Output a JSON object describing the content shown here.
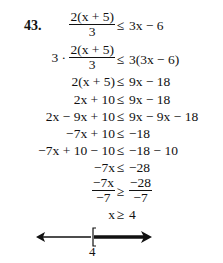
{
  "problem": {
    "number": "43.",
    "steps": [
      {
        "lhs": "",
        "lhs_frac": {
          "num": "2(x + 5)",
          "den": "3"
        },
        "rel": "≤",
        "rhs": "3x − 6"
      },
      {
        "lhs_prefix": "3 ·",
        "lhs_frac": {
          "num": "2(x + 5)",
          "den": "3"
        },
        "rel": "≤",
        "rhs": "3(3x − 6)"
      },
      {
        "lhs": "2(x + 5)",
        "rel": "≤",
        "rhs": "9x − 18"
      },
      {
        "lhs": "2x + 10",
        "rel": "≤",
        "rhs": "9x − 18"
      },
      {
        "lhs": "2x − 9x + 10",
        "rel": "≤",
        "rhs": "9x − 9x − 18"
      },
      {
        "lhs": "−7x + 10",
        "rel": "≤",
        "rhs": "−18"
      },
      {
        "lhs": "−7x + 10 − 10",
        "rel": "≤",
        "rhs": "−18 − 10"
      },
      {
        "lhs": "−7x",
        "rel": "≤",
        "rhs": "−28"
      },
      {
        "lhs_frac": {
          "num": "−7x",
          "den": "−7"
        },
        "rel": "≥",
        "rhs_frac": {
          "num": "−28",
          "den": "−7"
        }
      },
      {
        "lhs": "x",
        "rel": "≥",
        "rhs": "4"
      }
    ],
    "solution": "x ≥ 4",
    "number_line": {
      "endpoint": 4,
      "endpoint_label": "4",
      "bracket": "[",
      "closed": true,
      "shaded_direction": "right"
    }
  }
}
